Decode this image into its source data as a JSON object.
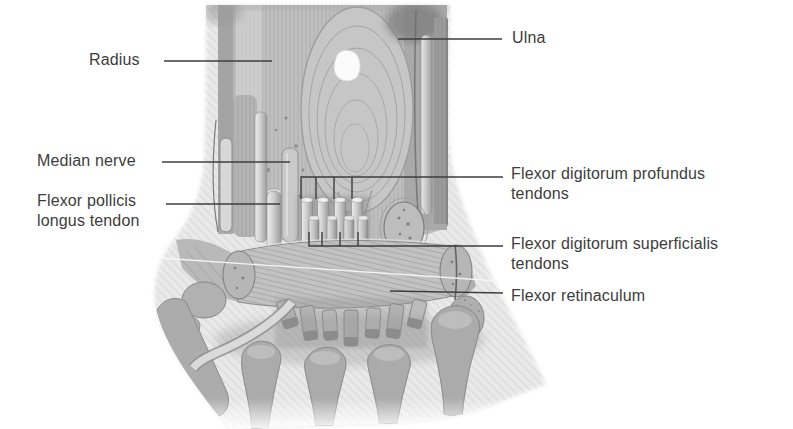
{
  "figure": {
    "labels": {
      "radius": "Radius",
      "ulna": "Ulna",
      "median_nerve": "Median nerve",
      "flexor_pollicis_longus": {
        "line1": "Flexor pollicis",
        "line2": "longus tendon"
      },
      "flexor_digitorum_profundus": {
        "line1": "Flexor digitorum profundus",
        "line2": "tendons"
      },
      "flexor_digitorum_superficialis": {
        "line1": "Flexor digitorum superficialis",
        "line2": "tendons"
      },
      "flexor_retinaculum": "Flexor retinaculum"
    },
    "colors": {
      "background": "#ffffff",
      "label_text": "#3d3d3d",
      "leader_line": "#3e3e3e",
      "illustration_light": "#e8e8e8",
      "illustration_mid": "#b5b5b5",
      "illustration_dark": "#7c7c7c",
      "highlight_white": "#fbfbfb"
    }
  }
}
